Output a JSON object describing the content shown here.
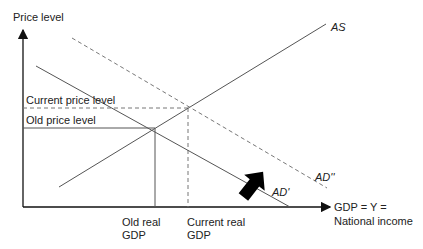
{
  "diagram": {
    "type": "AD-AS shift",
    "y_axis_label": "Price level",
    "x_axis_label_line1": "GDP = Y =",
    "x_axis_label_line2": "National income",
    "curves": {
      "as": "AS",
      "ad_old": "AD'",
      "ad_new": "AD''"
    },
    "price_levels": {
      "current": "Current price level",
      "old": "Old price level"
    },
    "gdp_levels": {
      "old_line1": "Old real",
      "old_line2": "GDP",
      "current_line1": "Current real",
      "current_line2": "GDP"
    },
    "colors": {
      "axis": "#111111",
      "line": "#555555",
      "arrow": "#000000"
    }
  }
}
